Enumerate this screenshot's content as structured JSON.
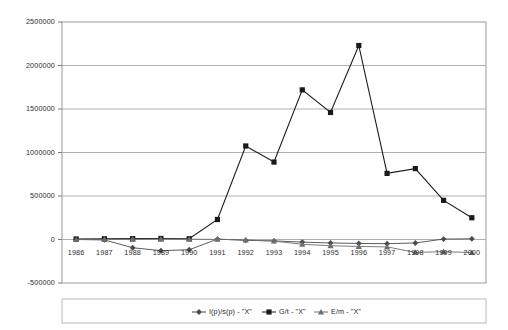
{
  "chart_data": {
    "type": "line",
    "title": "",
    "xlabel": "",
    "ylabel": "",
    "categories": [
      "1986",
      "1987",
      "1988",
      "1989",
      "1990",
      "1991",
      "1992",
      "1993",
      "1994",
      "1995",
      "1996",
      "1997",
      "1998",
      "1999",
      "2000"
    ],
    "ylim": [
      -500000,
      2500000
    ],
    "ytick_labels": [
      "2500000",
      "2000000",
      "1500000",
      "1000000",
      "500000",
      "0",
      "-500000"
    ],
    "ytick_values": [
      2500000,
      2000000,
      1500000,
      1000000,
      500000,
      0,
      -500000
    ],
    "grid": true,
    "legend_position": "bottom",
    "series": [
      {
        "name": "I(p)/s(p) - \"X\"",
        "marker": "diamond",
        "color": "#4a4a4a",
        "values": [
          0,
          -5000,
          -95000,
          -128000,
          -118000,
          5000,
          -10000,
          -16000,
          -30000,
          -40000,
          -45000,
          -48000,
          -40000,
          5000,
          8000
        ]
      },
      {
        "name": "G/t - \"X\"",
        "marker": "square",
        "color": "#1a1a1a",
        "values": [
          6000,
          8000,
          10000,
          12000,
          9000,
          230000,
          1075000,
          890000,
          1720000,
          1460000,
          2230000,
          760000,
          815000,
          450000,
          250000
        ]
      },
      {
        "name": "E/m - \"X\"",
        "marker": "triangle",
        "color": "#6e6e6e",
        "values": [
          0,
          2000,
          4000,
          4000,
          3000,
          2000,
          -5000,
          -18000,
          -55000,
          -72000,
          -80000,
          -85000,
          -148000,
          -140000,
          -150000
        ]
      }
    ]
  },
  "legend": {
    "entries": [
      {
        "label": "I(p)/s(p) - \"X\""
      },
      {
        "label": "G/t - \"X\""
      },
      {
        "label": "E/m - \"X\""
      }
    ]
  }
}
